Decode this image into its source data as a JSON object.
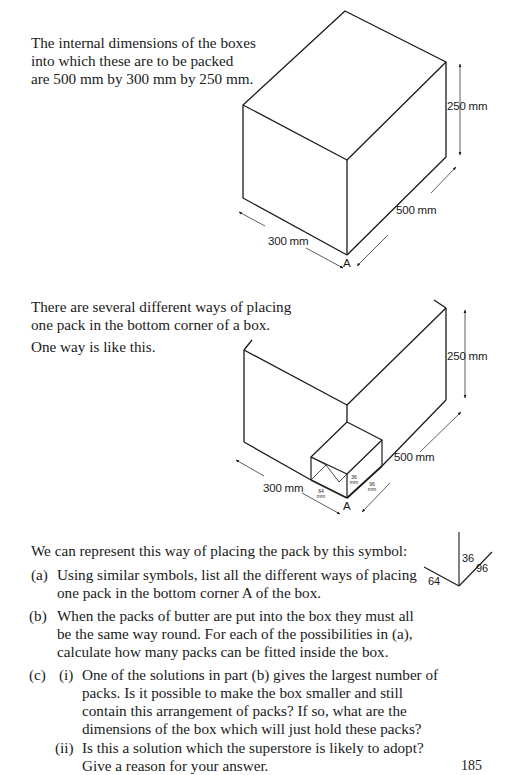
{
  "page": {
    "intro_lines": [
      "The internal dimensions of the boxes",
      "into which these are to be packed",
      "are 500 mm by 300 mm by 250 mm."
    ],
    "diagram1": {
      "height_label": "250 mm",
      "length_label": "500 mm",
      "width_label": "300 mm",
      "corner_label": "A"
    },
    "placing_lines": [
      "There are several different ways of placing",
      "one pack in the bottom corner of a box."
    ],
    "one_way": "One way is like this.",
    "diagram2": {
      "height_label": "250 mm",
      "length_label": "500 mm",
      "width_label": "300 mm",
      "corner_label": "A",
      "pack_dims": {
        "height": "36",
        "length": "96",
        "width": "64",
        "unit": "mm"
      }
    },
    "symbol_intro": "We can represent this way of placing the pack by this symbol:",
    "symbol": {
      "up": "36",
      "right": "96",
      "left": "64"
    },
    "questions": [
      {
        "marker": "(a)",
        "lines": [
          "Using similar symbols, list all the different ways of placing",
          "one pack in the bottom corner A of the box."
        ]
      },
      {
        "marker": "(b)",
        "lines": [
          "When the packs of butter are put into the box they must all",
          "be the same way round. For each of the possibilities in (a),",
          "calculate how many packs can be fitted inside the box."
        ]
      },
      {
        "marker": "(c)",
        "subparts": [
          {
            "marker": "(i)",
            "lines": [
              "One of the solutions in part (b) gives the largest number of",
              "packs. Is it possible to make the box smaller and still",
              "contain this arrangement of packs? If so, what are the",
              "dimensions of the box which will just hold these packs?"
            ]
          },
          {
            "marker": "(ii)",
            "lines": [
              "Is this a solution which the superstore is likely to adopt?",
              "Give a reason for your answer."
            ]
          }
        ]
      }
    ],
    "page_number": "185"
  }
}
